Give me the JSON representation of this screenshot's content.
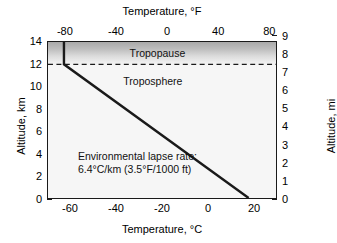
{
  "chart_data": {
    "type": "line",
    "title": "",
    "xlabel": "Temperature, °C",
    "xlabel_top": "Temperature, °F",
    "ylabel": "Altitude, km",
    "ylabel_right": "Altitude, mi",
    "xlim": [
      -70,
      30
    ],
    "ylim": [
      0,
      14
    ],
    "xlim_top_F": [
      -94,
      86
    ],
    "ylim_right_mi": [
      0,
      8.699
    ],
    "grid": false,
    "legend": null,
    "xticks_bottom": [
      "-60",
      "-40",
      "-20",
      "0",
      "20"
    ],
    "xticks_bottom_values": [
      -60,
      -40,
      -20,
      0,
      20
    ],
    "xticks_top": [
      "-80",
      "-40",
      "0",
      "40",
      "80"
    ],
    "xticks_top_values": [
      -80,
      -40,
      0,
      40,
      80
    ],
    "yticks_left": [
      "0",
      "2",
      "4",
      "6",
      "8",
      "10",
      "12",
      "14"
    ],
    "yticks_left_values": [
      0,
      2,
      4,
      6,
      8,
      10,
      12,
      14
    ],
    "yticks_right": [
      "0",
      "1",
      "2",
      "3",
      "4",
      "5",
      "6",
      "7",
      "8",
      "9"
    ],
    "yticks_right_values": [
      0,
      1,
      2,
      3,
      4,
      5,
      6,
      7,
      8,
      9
    ],
    "series": [
      {
        "name": "Environmental lapse rate profile",
        "x": [
          18.0,
          -63.0,
          -63.0
        ],
        "y": [
          0,
          12,
          14
        ],
        "color": "#1a1a1a",
        "width": 2.4
      }
    ],
    "reference_lines": [
      {
        "name": "tropopause",
        "orientation": "horizontal",
        "y": 12,
        "style": "dashed",
        "color": "#1a1a1a"
      }
    ],
    "regions": [
      {
        "name": "tropopause",
        "label": "Tropopause",
        "y_range": [
          12,
          14
        ],
        "shading": "gradient-gray"
      },
      {
        "name": "troposphere",
        "label": "Troposphere",
        "y_range": [
          0,
          12
        ],
        "shading": "light"
      }
    ],
    "annotations": [
      {
        "name": "lapse-rate-note",
        "line1": "Environmental lapse rate:",
        "line2": "6.4°C/km (3.5°F/1000 ft)",
        "x": -57,
        "y": 3.2
      }
    ]
  },
  "axes": {
    "top": {
      "title": "Temperature, °F"
    },
    "bottom": {
      "title": "Temperature, °C"
    },
    "left": {
      "title": "Altitude, km"
    },
    "right": {
      "title": "Altitude, mi"
    }
  },
  "labels": {
    "tropopause": "Tropopause",
    "troposphere": "Troposphere"
  },
  "annotation": {
    "line1": "Environmental lapse rate:",
    "line2": "6.4°C/km (3.5°F/1000 ft)"
  },
  "colors": {
    "axis": "#1a1a1a",
    "line": "#1a1a1a",
    "troposphere_fill": "#f6f6f6",
    "tropopause_top": "#a9a9a9",
    "background": "#ffffff"
  }
}
